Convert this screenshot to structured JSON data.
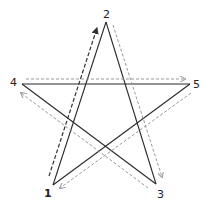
{
  "diagram": {
    "points": [
      {
        "id": "1",
        "label": "1",
        "x": 53,
        "y": 185,
        "lx": 46,
        "ly": 196
      },
      {
        "id": "2",
        "label": "2",
        "x": 106,
        "y": 22,
        "lx": 103,
        "ly": 18
      },
      {
        "id": "3",
        "label": "3",
        "x": 156,
        "y": 184,
        "lx": 157,
        "ly": 197
      },
      {
        "id": "4",
        "label": "4",
        "x": 22,
        "y": 84,
        "lx": 11,
        "ly": 85
      },
      {
        "id": "5",
        "label": "5",
        "x": 190,
        "y": 84,
        "lx": 194,
        "ly": 87
      }
    ],
    "stroke_order": [
      "1",
      "2",
      "3",
      "4",
      "5",
      "1"
    ],
    "colors": {
      "star_line": "#2a2a2a",
      "first_arrow": "#333333",
      "arrows": "#9a9a9a",
      "label": "#222222"
    }
  }
}
